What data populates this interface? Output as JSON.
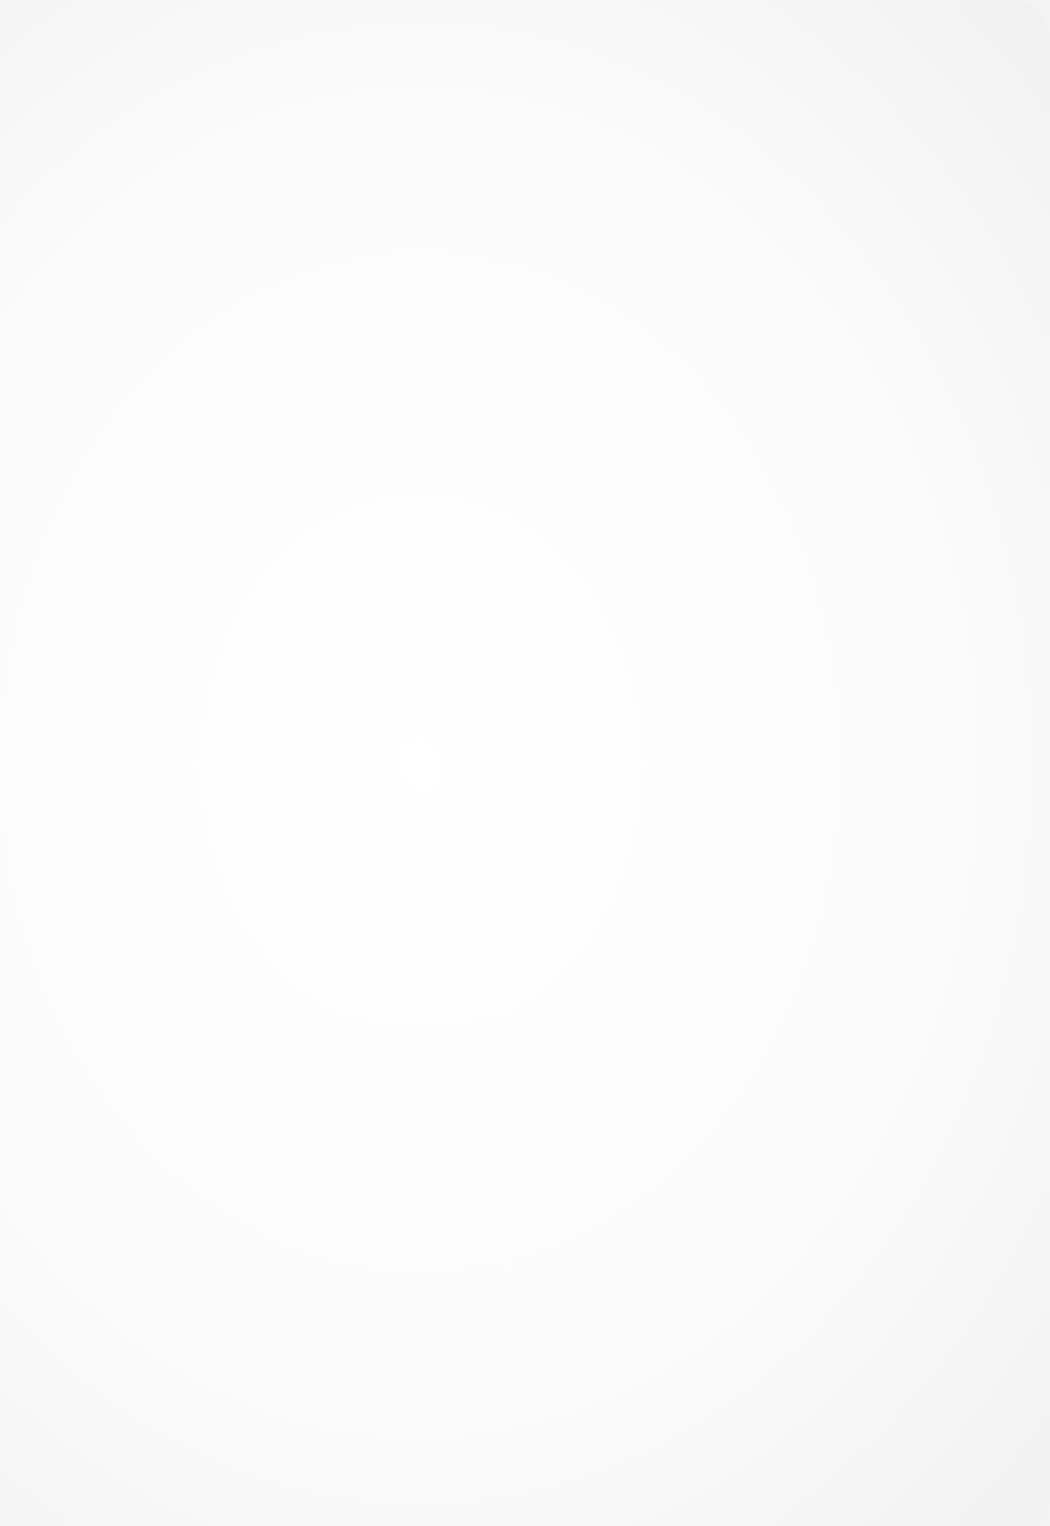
{
  "page": {
    "type": "lined-paper",
    "background_color": "#ffffff",
    "line_color": "#7a7a7a",
    "top_line_y": 68,
    "ruled_lines_y": [
      180,
      243,
      306,
      369,
      432,
      495,
      558,
      621,
      684,
      747,
      810,
      873,
      936,
      999,
      1062,
      1125,
      1188,
      1251,
      1314,
      1377,
      1440,
      1500
    ]
  }
}
